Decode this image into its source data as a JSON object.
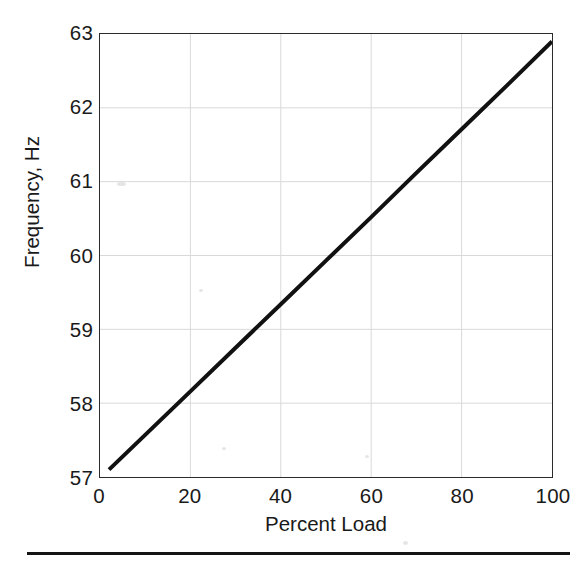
{
  "chart_data": {
    "type": "line",
    "title": "",
    "subtitle": "",
    "xlabel": "Percent Load",
    "ylabel": "Frequency, Hz",
    "xlim": [
      0,
      100
    ],
    "ylim": [
      57,
      63
    ],
    "xticks": [
      0,
      20,
      40,
      60,
      80,
      100
    ],
    "yticks": [
      57,
      58,
      59,
      60,
      61,
      62,
      63
    ],
    "xtick_labels": [
      "0",
      "20",
      "40",
      "60",
      "80",
      "100"
    ],
    "ytick_labels": [
      "57",
      "58",
      "59",
      "60",
      "61",
      "62",
      "63"
    ],
    "grid": true,
    "grid_color": "#d9d9d9",
    "legend": null,
    "legend_position": "none",
    "series": [
      {
        "name": "Frequency droop",
        "color": "#111111",
        "line_width": 4,
        "marker": "none",
        "x": [
          2,
          10,
          20,
          30,
          40,
          50,
          60,
          70,
          80,
          90,
          100
        ],
        "y": [
          57.1,
          57.57,
          58.16,
          58.75,
          59.34,
          59.93,
          60.52,
          61.12,
          61.71,
          62.3,
          62.9
        ]
      }
    ],
    "annotations": []
  },
  "figure": {
    "background_color": "#ffffff",
    "axes_color": "#2b2b2b",
    "text_color": "#1a1a1a",
    "bottom_rule": true
  }
}
